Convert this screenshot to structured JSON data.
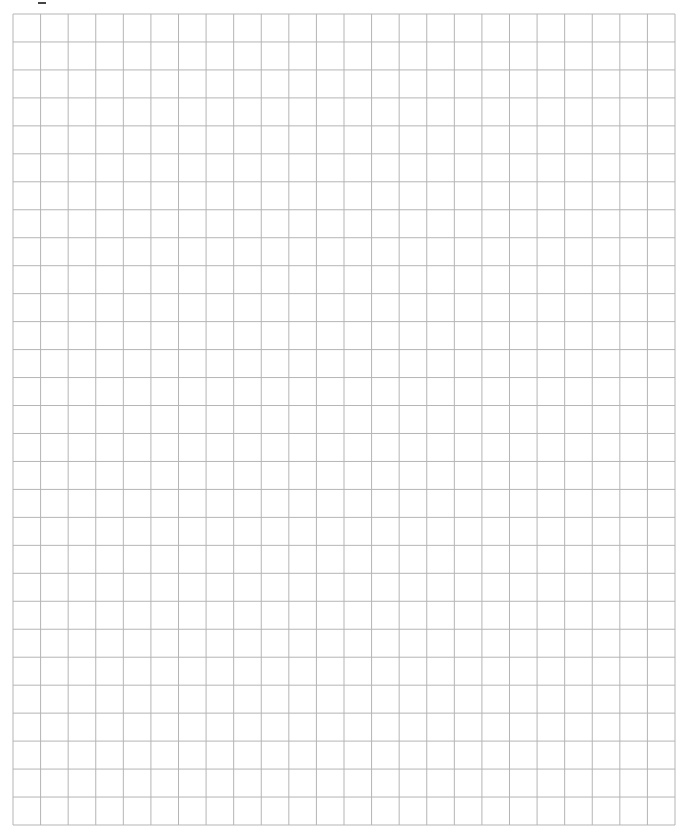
{
  "page": {
    "type": "blank graph paper grid"
  },
  "grid": {
    "columns": 24,
    "rows": 29,
    "line_color": "#b5b5b5"
  }
}
